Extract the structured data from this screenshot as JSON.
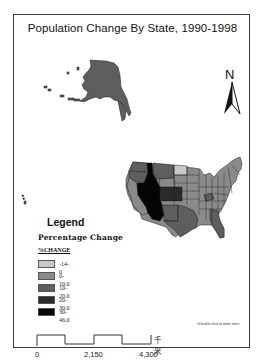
{
  "map": {
    "title": "Population Change By State, 1990-1998",
    "north_arrow": {
      "label": "N",
      "icon": "north-arrow-icon"
    },
    "regions": [
      "Alaska",
      "Hawaii",
      "Contiguous United States"
    ]
  },
  "legend": {
    "title": "Legend",
    "subtitle": "Percentage Change",
    "field": "%CHANGE",
    "items": [
      {
        "label": "-14-0",
        "color": "#c8c8c8"
      },
      {
        "label": "0-10.0",
        "color": "#8a8a8a"
      },
      {
        "label": "10-20.0",
        "color": "#5e5e5e"
      },
      {
        "label": "20-30.0",
        "color": "#2a2a2a"
      },
      {
        "label": "30-46.0",
        "color": "#050505"
      }
    ]
  },
  "text_placeholder": "<Double-click to enter text>",
  "scale_bar": {
    "ticks": [
      "0",
      "2,150",
      "4,300"
    ],
    "unit": "千米"
  },
  "colors": {
    "frame": "#3a3a3a",
    "state_border": "#1a1a1a"
  }
}
